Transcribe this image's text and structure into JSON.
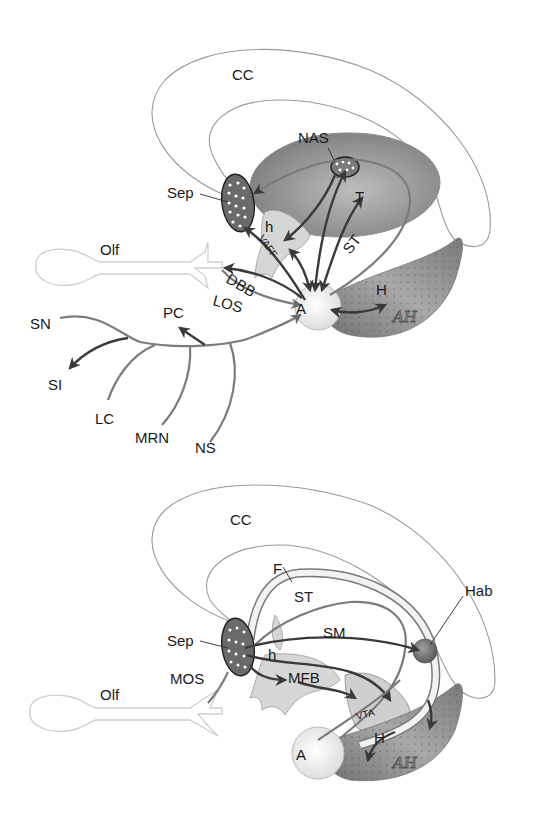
{
  "diagram": {
    "panels": [
      {
        "id": "top",
        "labels": {
          "cc": "CC",
          "nas": "NAS",
          "sep": "Sep",
          "t": "T",
          "h_small": "h",
          "vaff": "VAFF",
          "st": "ST",
          "olf": "Olf",
          "dbb": "DBB",
          "los": "LOS",
          "a": "A",
          "h": "H",
          "ah": "AH",
          "pc": "PC",
          "sn": "SN",
          "si": "SI",
          "lc": "LC",
          "mrn": "MRN",
          "ns": "NS"
        }
      },
      {
        "id": "bottom",
        "labels": {
          "cc": "CC",
          "f": "F",
          "st": "ST",
          "hab": "Hab",
          "sm": "SM",
          "sep": "Sep",
          "h_small": "h",
          "mos": "MOS",
          "mfb": "MFB",
          "olf": "Olf",
          "vta": "VTA",
          "a": "A",
          "h": "H",
          "ah": "AH"
        }
      }
    ],
    "colors": {
      "fiber_light": "#7b7b7b",
      "fiber_dark": "#3a3a3a",
      "region_dark": "#6e6e6e",
      "region_mid": "#9a9a9a",
      "region_light": "#d9d9d9",
      "outline": "#9a9a9a"
    }
  }
}
